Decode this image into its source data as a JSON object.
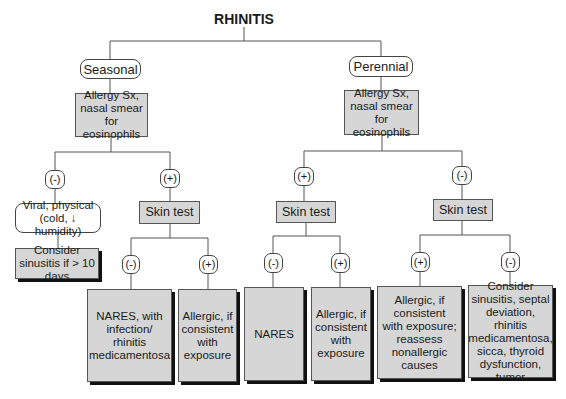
{
  "title": "RHINITIS",
  "branches": {
    "seasonal": {
      "label": "Seasonal",
      "workup": "Allergy Sx, nasal smear for eosinophils",
      "neg": {
        "sign": "(-)",
        "result": "Viral, physical (cold, ↓ humidity)",
        "next": "Consider sinusitis if > 10 days"
      },
      "pos": {
        "sign": "(+)",
        "test": "Skin test",
        "neg": {
          "sign": "(-)",
          "result": "NARES, with infection/ rhinitis medicamentosa"
        },
        "pos": {
          "sign": "(+)",
          "result": "Allergic, if consistent with exposure"
        }
      }
    },
    "perennial": {
      "label": "Perennial",
      "workup": "Allergy Sx, nasal smear for eosinophils",
      "pos": {
        "sign": "(+)",
        "test": "Skin test",
        "neg": {
          "sign": "(-)",
          "result": "NARES"
        },
        "pos": {
          "sign": "(+)",
          "result": "Allergic, if consistent with exposure"
        }
      },
      "neg": {
        "sign": "(-)",
        "test": "Skin test",
        "pos": {
          "sign": "(+)",
          "result": "Allergic, if consistent with exposure; reassess nonallergic causes"
        },
        "neg": {
          "sign": "(-)",
          "result": "Consider sinusitis, septal deviation, rhinitis medicamentosa, sicca, thyroid dysfunction, tumor"
        }
      }
    }
  }
}
